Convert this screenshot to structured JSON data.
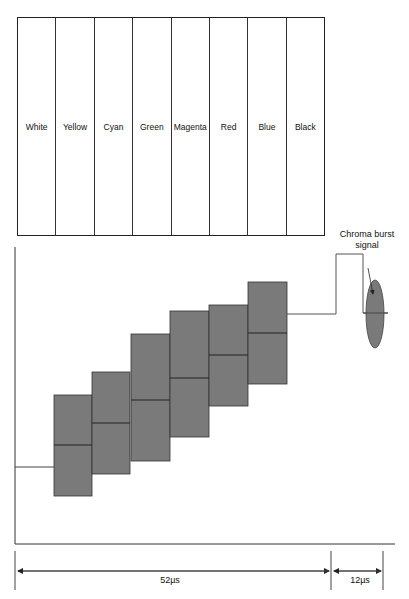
{
  "color_bars": {
    "labels": [
      "White",
      "Yellow",
      "Cyan",
      "Green",
      "Magenta",
      "Red",
      "Blue",
      "Black"
    ]
  },
  "waveform": {
    "burst_label_line1": "Chroma burst",
    "burst_label_line2": "signal",
    "box_fill": "#7a7a7a",
    "steps": [
      {
        "x": 54,
        "w": 38,
        "top": 395,
        "bottom": 496,
        "mid": 445
      },
      {
        "x": 92,
        "w": 38,
        "top": 372,
        "bottom": 474,
        "mid": 423
      },
      {
        "x": 131,
        "w": 39,
        "top": 334,
        "bottom": 461,
        "mid": 400
      },
      {
        "x": 170,
        "w": 39,
        "top": 311,
        "bottom": 437,
        "mid": 378
      },
      {
        "x": 209,
        "w": 39,
        "top": 305,
        "bottom": 406,
        "mid": 355
      },
      {
        "x": 248,
        "w": 39,
        "top": 282,
        "bottom": 384,
        "mid": 333
      }
    ]
  },
  "timing": {
    "active_label": "52µs",
    "blanking_label": "12µs"
  }
}
